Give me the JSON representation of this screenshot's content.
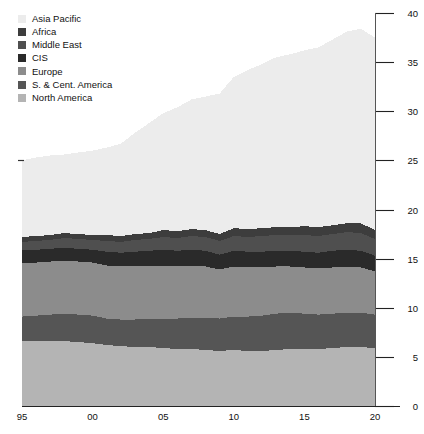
{
  "legend": {
    "position": "top-left",
    "items": [
      {
        "label": "Asia Pacific",
        "color": "#ececec"
      },
      {
        "label": "Africa",
        "color": "#3d3d3d"
      },
      {
        "label": "Middle East",
        "color": "#4f4f4f"
      },
      {
        "label": "CIS",
        "color": "#2a2a2a"
      },
      {
        "label": "Europe",
        "color": "#8c8c8c"
      },
      {
        "label": "S. & Cent. America",
        "color": "#555555"
      },
      {
        "label": "North America",
        "color": "#b4b4b4"
      }
    ]
  },
  "axes": {
    "y_ticks": [
      "0",
      "5",
      "10",
      "15",
      "20",
      "25",
      "30",
      "35",
      "40"
    ],
    "x_ticks": [
      "95",
      "00",
      "05",
      "10",
      "15",
      "20"
    ]
  },
  "chart_data": {
    "type": "area",
    "title": "",
    "subtitle": "",
    "xlabel": "",
    "ylabel": "",
    "stacked": true,
    "grid": false,
    "legend_position": "top-left",
    "y_axis_side": "right",
    "xlim": [
      1995,
      2020
    ],
    "ylim": [
      0,
      40
    ],
    "y_ticks": [
      0,
      5,
      10,
      15,
      20,
      25,
      30,
      35,
      40
    ],
    "x_tick_values": [
      1995,
      2000,
      2005,
      2010,
      2015,
      2020
    ],
    "x_tick_labels": [
      "95",
      "00",
      "05",
      "10",
      "15",
      "20"
    ],
    "x": [
      1995,
      1996,
      1997,
      1998,
      1999,
      2000,
      2001,
      2002,
      2003,
      2004,
      2005,
      2006,
      2007,
      2008,
      2009,
      2010,
      2011,
      2012,
      2013,
      2014,
      2015,
      2016,
      2017,
      2018,
      2019,
      2020
    ],
    "series": [
      {
        "name": "North America",
        "color": "#b4b4b4",
        "values": [
          6.6,
          6.6,
          6.6,
          6.6,
          6.5,
          6.4,
          6.2,
          6.1,
          6.0,
          6.0,
          5.9,
          5.8,
          5.8,
          5.7,
          5.6,
          5.7,
          5.6,
          5.6,
          5.7,
          5.8,
          5.8,
          5.8,
          5.9,
          6.0,
          6.0,
          5.9
        ]
      },
      {
        "name": "S. & Cent. America",
        "color": "#555555",
        "values": [
          2.5,
          2.6,
          2.7,
          2.8,
          2.8,
          2.8,
          2.7,
          2.7,
          2.8,
          2.9,
          3.0,
          3.1,
          3.2,
          3.3,
          3.3,
          3.4,
          3.5,
          3.6,
          3.7,
          3.7,
          3.6,
          3.5,
          3.5,
          3.5,
          3.5,
          3.4
        ]
      },
      {
        "name": "Europe",
        "color": "#8c8c8c",
        "values": [
          5.4,
          5.4,
          5.4,
          5.4,
          5.4,
          5.4,
          5.4,
          5.4,
          5.4,
          5.4,
          5.4,
          5.3,
          5.3,
          5.2,
          5.0,
          5.1,
          5.0,
          4.9,
          4.8,
          4.7,
          4.7,
          4.7,
          4.7,
          4.7,
          4.6,
          4.4
        ]
      },
      {
        "name": "CIS",
        "color": "#2a2a2a",
        "values": [
          1.4,
          1.3,
          1.3,
          1.3,
          1.3,
          1.3,
          1.4,
          1.4,
          1.5,
          1.5,
          1.6,
          1.6,
          1.6,
          1.6,
          1.5,
          1.6,
          1.6,
          1.6,
          1.6,
          1.6,
          1.6,
          1.6,
          1.7,
          1.7,
          1.7,
          1.6
        ]
      },
      {
        "name": "Middle East",
        "color": "#4f4f4f",
        "values": [
          0.8,
          0.9,
          0.9,
          1.0,
          1.0,
          1.0,
          1.1,
          1.1,
          1.2,
          1.2,
          1.3,
          1.3,
          1.4,
          1.4,
          1.4,
          1.5,
          1.5,
          1.6,
          1.6,
          1.6,
          1.7,
          1.7,
          1.7,
          1.8,
          1.8,
          1.7
        ]
      },
      {
        "name": "Africa",
        "color": "#3d3d3d",
        "values": [
          0.5,
          0.5,
          0.5,
          0.5,
          0.5,
          0.5,
          0.6,
          0.6,
          0.6,
          0.6,
          0.7,
          0.7,
          0.7,
          0.7,
          0.7,
          0.8,
          0.8,
          0.8,
          0.8,
          0.8,
          0.9,
          0.9,
          0.9,
          0.9,
          1.0,
          0.9
        ]
      },
      {
        "name": "Asia Pacific",
        "color": "#ececec",
        "values": [
          7.8,
          8.0,
          8.1,
          8.0,
          8.3,
          8.6,
          8.9,
          9.4,
          10.3,
          11.2,
          11.9,
          12.6,
          13.2,
          13.6,
          14.3,
          15.4,
          16.2,
          16.7,
          17.3,
          17.6,
          17.9,
          18.3,
          18.9,
          19.5,
          19.8,
          19.6
        ]
      }
    ],
    "totals": [
      25.0,
      25.3,
      25.5,
      25.6,
      25.8,
      26.0,
      26.3,
      26.7,
      27.8,
      28.8,
      29.8,
      30.4,
      31.2,
      31.5,
      31.8,
      33.5,
      34.2,
      34.8,
      35.5,
      35.8,
      36.2,
      36.5,
      37.3,
      38.1,
      38.4,
      37.5
    ]
  }
}
